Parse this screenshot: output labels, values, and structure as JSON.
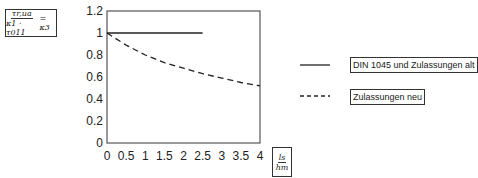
{
  "chart_data": {
    "type": "line",
    "title": "",
    "ylabel": "τ_r,ua / (κ1 · τ011) = κ3",
    "ylabel_parts": {
      "num": "τr,ua",
      "den": "κ1 · τ011",
      "rhs": "= κ3"
    },
    "xlabel": "ls / hm",
    "xlabel_parts": {
      "num": "ls",
      "den": "hm"
    },
    "xlim": [
      0,
      4
    ],
    "ylim": [
      0,
      1.2
    ],
    "xticks": [
      0,
      0.5,
      1,
      1.5,
      2,
      2.5,
      3,
      3.5,
      4
    ],
    "xtick_labels": [
      "0",
      "0.5",
      "1",
      "1.5",
      "2",
      "2.5",
      "3",
      "3.5",
      "4"
    ],
    "yticks": [
      0,
      0.2,
      0.4,
      0.6,
      0.8,
      1,
      1.2
    ],
    "ytick_labels": [
      "0",
      "0.2",
      "0.4",
      "0.6",
      "0.8",
      "1",
      "1.2"
    ],
    "grid": false,
    "legend_position": "right",
    "series": [
      {
        "name": "DIN 1045 und Zulassungen alt",
        "style": "solid",
        "x": [
          0,
          2.5
        ],
        "y": [
          1.0,
          1.0
        ]
      },
      {
        "name": "Zulassungen neu",
        "style": "dashed",
        "x": [
          0,
          0.5,
          1,
          1.5,
          2,
          2.5,
          3,
          3.5,
          4
        ],
        "y": [
          1.0,
          0.89,
          0.8,
          0.73,
          0.68,
          0.63,
          0.59,
          0.55,
          0.52
        ]
      }
    ]
  },
  "legend": [
    {
      "label": "DIN 1045 und Zulassungen alt",
      "style": "solid"
    },
    {
      "label": "Zulassungen neu",
      "style": "dashed"
    }
  ],
  "colors": {
    "line": "#222222",
    "axis": "#555555"
  }
}
